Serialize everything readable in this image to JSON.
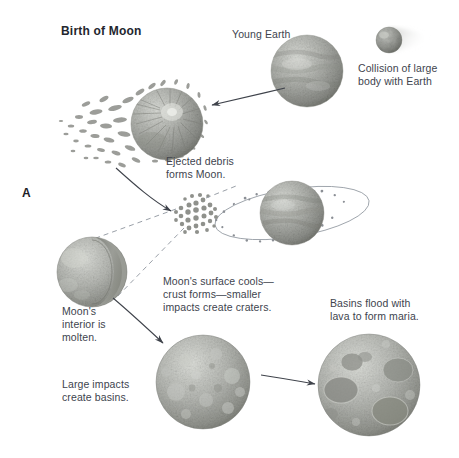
{
  "figure": {
    "title": "Birth of Moon",
    "panel_letter": "A",
    "width": 459,
    "height": 458,
    "background": "#ffffff",
    "text_color": "#40444e",
    "title_color": "#23262e"
  },
  "labels": {
    "young_earth": "Young Earth",
    "collision": "Collision of large\nbody with Earth",
    "ejected_debris": "Ejected debris\nforms Moon.",
    "molten_interior": "Moon's\ninterior is\nmolten.",
    "surface_cools": "Moon's surface cools—\ncrust forms—smaller\nimpacts create craters.",
    "basins_flood": "Basins flood with\nlava to form maria.",
    "large_impacts": "Large impacts\ncreate basins."
  },
  "stages": [
    {
      "id": "young-earth",
      "name": "Young Earth",
      "shape": "planet-sphere",
      "cx": 307,
      "cy": 71,
      "r": 36,
      "fill": "#a7a9a4",
      "description": "Young Earth sphere with banded cloud texture"
    },
    {
      "id": "impactor-body",
      "name": "Large impacting body",
      "shape": "small-sphere-with-motion-blur",
      "cx": 389,
      "cy": 40,
      "r": 13,
      "fill": "#8f9490",
      "description": "Small dark body with blur trail moving toward Earth"
    },
    {
      "id": "impacted-earth",
      "name": "Earth ejecting debris",
      "shape": "planet-sphere-with-ejecta",
      "cx": 167,
      "cy": 124,
      "r": 36,
      "fill": "#9a9c98",
      "description": "Earth after impact with spray of ejected debris to the left"
    },
    {
      "id": "proto-moon-cluster",
      "name": "Debris cluster forming Moon",
      "shape": "particle-cluster",
      "cx": 196,
      "cy": 213,
      "r": 21,
      "fill": "#9d9f9b",
      "description": "Loose cluster of accreting particles"
    },
    {
      "id": "orbiting-earth",
      "name": "Earth with debris ring",
      "shape": "planet-sphere-with-ring",
      "cx": 292,
      "cy": 213,
      "r": 32,
      "fill": "#a3a5a0",
      "ring_rx": 78,
      "ring_ry": 24,
      "description": "Earth encircled by elliptical ring of orbiting debris"
    },
    {
      "id": "molten-moon",
      "name": "Moon with molten interior cutaway",
      "shape": "sphere-cutaway",
      "cx": 92,
      "cy": 272,
      "r": 35,
      "fill": "#a6a8a3",
      "core_fill": "#8b8d89",
      "description": "Moon cut away revealing molten interior"
    },
    {
      "id": "cratered-moon",
      "name": "Moon with craters",
      "shape": "cratered-sphere",
      "cx": 203,
      "cy": 382,
      "r": 47,
      "fill": "#a9aba6",
      "description": "Moon with cooled crust and many small craters"
    },
    {
      "id": "maria-moon",
      "name": "Moon with maria basins",
      "shape": "maria-sphere",
      "cx": 369,
      "cy": 385,
      "r": 51,
      "fill": "#aaaca7",
      "description": "Moon with large dark basins flooded by lava"
    }
  ],
  "connectors": [
    {
      "id": "arrow-collision-to-ejecta",
      "type": "arrow",
      "from": "young-earth",
      "to": "impacted-earth"
    },
    {
      "id": "arrow-ejecta-to-cluster",
      "type": "arrow",
      "from": "impacted-earth",
      "to": "proto-moon-cluster"
    },
    {
      "id": "arrow-molten-to-cratered",
      "type": "arrow",
      "from": "molten-moon",
      "to": "cratered-moon"
    },
    {
      "id": "arrow-cratered-to-maria",
      "type": "arrow",
      "from": "cratered-moon",
      "to": "maria-moon"
    },
    {
      "id": "callout-upper",
      "type": "dashed-leader",
      "from": "proto-moon-cluster",
      "to": "molten-moon"
    },
    {
      "id": "callout-lower",
      "type": "dashed-leader",
      "from": "proto-moon-cluster",
      "to": "molten-moon"
    }
  ],
  "colors": {
    "line": "#3f434b",
    "dashed": "#9aa0a8",
    "ring": "#9ba1a8",
    "sphere_light": "#cfd1cc",
    "sphere_mid": "#a6a8a3",
    "sphere_dark": "#74766f"
  }
}
